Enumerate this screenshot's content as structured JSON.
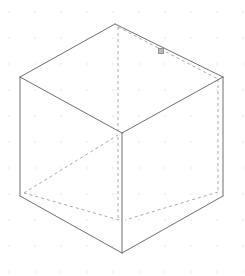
{
  "app": {
    "title": "Isometric Wireframe Canvas",
    "view_mode": "Isometric",
    "background_color": "#ffffff"
  },
  "canvas": {
    "width": 245,
    "height": 276,
    "grid": {
      "visible": true,
      "dot_spacing": 26,
      "origin_x": 9,
      "origin_y": 12,
      "dot_radius": 0.7,
      "color": "#d9dcdf"
    }
  },
  "style": {
    "visible_edge_color": "#6b6f73",
    "hidden_edge_color": "#a7abaf",
    "visible_edge_width": 1,
    "hidden_edge_width": 1,
    "hidden_dash_pattern": "3 3",
    "snap_marker_fill": "#b9bcc0",
    "snap_marker_stroke": "#7d8184"
  },
  "shape": {
    "name": "cube",
    "projection": "isometric",
    "vertices": {
      "top": {
        "x": 115,
        "y": 24
      },
      "left": {
        "x": 20,
        "y": 77
      },
      "right": {
        "x": 223,
        "y": 77
      },
      "center": {
        "x": 122,
        "y": 133
      },
      "lower_left": {
        "x": 20,
        "y": 196
      },
      "lower_right": {
        "x": 223,
        "y": 196
      },
      "bottom": {
        "x": 122,
        "y": 253
      },
      "hidden_back": {
        "x": 122,
        "y": 220
      }
    },
    "visible_edges": [
      {
        "name": "top-to-left",
        "from": "top",
        "to": "left"
      },
      {
        "name": "top-to-right",
        "from": "top",
        "to": "right"
      },
      {
        "name": "left-to-center",
        "from": "left",
        "to": "center"
      },
      {
        "name": "right-to-center",
        "from": "right",
        "to": "center"
      },
      {
        "name": "left-edge-vertical",
        "from": "left",
        "to": "lower_left"
      },
      {
        "name": "right-edge-vertical",
        "from": "right",
        "to": "lower_right"
      },
      {
        "name": "center-vertical",
        "from": "center",
        "to": "bottom"
      },
      {
        "name": "lower-left-to-bottom",
        "from": "lower_left",
        "to": "bottom"
      },
      {
        "name": "lower-right-to-bottom",
        "from": "lower_right",
        "to": "bottom"
      }
    ],
    "hidden_edges": [
      {
        "name": "top-to-back-vertical",
        "from": {
          "x": 118,
          "y": 27
        },
        "to": {
          "x": 118,
          "y": 130
        }
      },
      {
        "name": "top-to-rear-right",
        "from": {
          "x": 118,
          "y": 27
        },
        "to": {
          "x": 218,
          "y": 79
        }
      },
      {
        "name": "rear-right-vertical",
        "from": {
          "x": 218,
          "y": 79
        },
        "to": {
          "x": 218,
          "y": 192
        }
      },
      {
        "name": "rear-right-to-back-bottom",
        "from": {
          "x": 218,
          "y": 192
        },
        "to": {
          "x": 125,
          "y": 220
        }
      },
      {
        "name": "back-bottom-to-rear-left",
        "from": {
          "x": 119,
          "y": 220
        },
        "to": {
          "x": 24,
          "y": 193
        }
      },
      {
        "name": "rear-left-to-center",
        "from": {
          "x": 24,
          "y": 193
        },
        "to": {
          "x": 118,
          "y": 135
        }
      },
      {
        "name": "center-to-back-bottom",
        "from": {
          "x": 118,
          "y": 137
        },
        "to": {
          "x": 118,
          "y": 218
        }
      }
    ],
    "snap_marker": {
      "name": "snap-point-marker",
      "x": 161,
      "y": 51,
      "size": 5,
      "shape": "square"
    }
  }
}
